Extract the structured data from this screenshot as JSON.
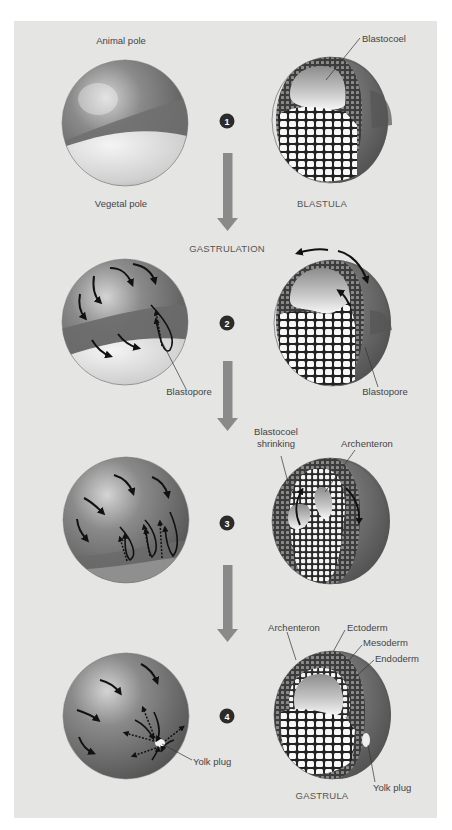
{
  "figure": {
    "flow_label": "GASTRULATION",
    "colors": {
      "background": "#e5e5e3",
      "arrow": "#8a8a8a",
      "marker": "#2b2b2b",
      "band": "#6e6e6e",
      "sphere_dark": "#5f5f5f",
      "sphere_light": "#d8d8d8"
    },
    "stages": [
      {
        "number": "1",
        "left_labels": {
          "top": "Animal pole",
          "bottom": "Vegetal pole"
        },
        "right_labels": {
          "blastocoel": "Blastocoel",
          "caption": "BLASTULA"
        }
      },
      {
        "number": "2",
        "left_labels": {
          "blastopore": "Blastopore"
        },
        "right_labels": {
          "blastopore": "Blastopore"
        }
      },
      {
        "number": "3",
        "right_labels": {
          "blastocoel_line1": "Blastocoel",
          "blastocoel_line2": "shrinking",
          "archenteron": "Archenteron"
        }
      },
      {
        "number": "4",
        "left_labels": {
          "yolk_plug": "Yolk plug"
        },
        "right_labels": {
          "archenteron": "Archenteron",
          "ectoderm": "Ectoderm",
          "mesoderm": "Mesoderm",
          "endoderm": "Endoderm",
          "yolk_plug": "Yolk plug",
          "caption": "GASTRULA"
        }
      }
    ]
  }
}
